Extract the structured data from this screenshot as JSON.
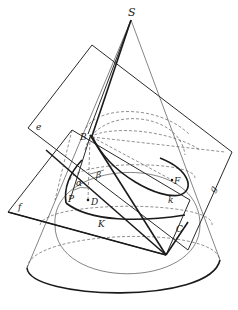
{
  "diagram": {
    "labels": {
      "apex": "S",
      "plane_upper": "e",
      "plane_lower": "f",
      "point_B": "B",
      "angle_alpha": "α",
      "angle_beta": "β",
      "point_P": "P",
      "point_D": "D",
      "point_F": "F",
      "curve_k": "k",
      "curve_K": "K",
      "point_C": "C",
      "line_g": "g"
    },
    "colors": {
      "ink": "#1a1a1a",
      "background": "#ffffff"
    }
  }
}
